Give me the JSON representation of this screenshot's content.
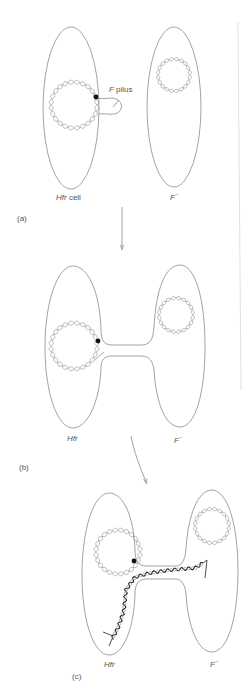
{
  "figure": {
    "panels": [
      {
        "id": "a",
        "tag": "(a)",
        "left_cell_label_italic": "Hfr",
        "left_cell_label_rest": " cell",
        "right_cell_label": "F",
        "right_cell_sup": "−",
        "pilus_label_italic": "F",
        "pilus_label_rest": " pilus"
      },
      {
        "id": "b",
        "tag": "(b)",
        "left_cell_label_italic": "Hfr",
        "right_cell_label": "F",
        "right_cell_sup": "−"
      },
      {
        "id": "c",
        "tag": "(c)",
        "left_cell_label_italic": "Hfr",
        "right_cell_label": "F",
        "right_cell_sup": "−"
      }
    ],
    "colors": {
      "outline": "#8a8a8a",
      "dna": "#9a9a9a",
      "transferred_dna": "#222222",
      "origin_dot": "#111111",
      "arrow": "#888888"
    }
  }
}
